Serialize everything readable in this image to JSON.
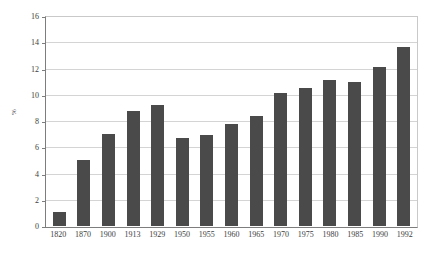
{
  "chart_data": {
    "type": "bar",
    "title": "",
    "subtitle": "",
    "xlabel": "",
    "ylabel": "%",
    "categories": [
      "1820",
      "1870",
      "1900",
      "1913",
      "1929",
      "1950",
      "1955",
      "1960",
      "1965",
      "1970",
      "1975",
      "1980",
      "1985",
      "1990",
      "1992"
    ],
    "values": [
      1.05,
      5.1,
      7.1,
      8.85,
      9.3,
      6.75,
      7.0,
      7.85,
      8.5,
      10.25,
      10.6,
      11.2,
      11.1,
      12.25,
      13.75
    ],
    "ylim": [
      0,
      16
    ],
    "ytick_values": [
      0,
      2,
      4,
      6,
      8,
      10,
      12,
      14,
      16
    ],
    "ytick_labels": [
      "0",
      "2",
      "4",
      "6",
      "8",
      "10",
      "12",
      "14",
      "16"
    ],
    "grid": true,
    "grid_axis": "y",
    "legend": false,
    "legend_position": "none",
    "series": [
      {
        "name": "",
        "color": "#4a4a4a",
        "values": [
          1.05,
          5.1,
          7.1,
          8.85,
          9.3,
          6.75,
          7.0,
          7.85,
          8.5,
          10.25,
          10.6,
          11.2,
          11.1,
          12.25,
          13.75
        ]
      }
    ]
  },
  "style": {
    "bar_color": "#4a4a4a",
    "grid_color": "#d4d4d4",
    "axis_color": "#7d7d7d",
    "frame_color": "#c9c9c9",
    "background": "#ffffff",
    "text_color": "#3d3d3d"
  }
}
